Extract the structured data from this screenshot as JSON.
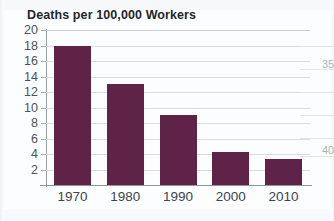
{
  "chart_data": {
    "type": "bar",
    "title": "Deaths per 100,000 Workers",
    "xlabel": "",
    "ylabel": "",
    "categories": [
      "1970",
      "1980",
      "1990",
      "2000",
      "2010"
    ],
    "values": [
      18,
      13,
      9,
      4.2,
      3.4
    ],
    "series": [
      {
        "name": "Deaths per 100,000 Workers",
        "values": [
          18,
          13,
          9,
          4.2,
          3.4
        ]
      }
    ],
    "ylim": [
      0,
      20
    ],
    "yticks": [
      "2",
      "4",
      "6",
      "8",
      "10",
      "12",
      "14",
      "16",
      "18",
      "20"
    ],
    "ytick_values": [
      2,
      4,
      6,
      8,
      10,
      12,
      14,
      16,
      18,
      20
    ],
    "grid": true,
    "legend": false,
    "legend_position": "none",
    "bar_color": "#5e2347",
    "gridline_color": "#d9dde1",
    "axis_color": "#8e959c",
    "title_color": "#23272b",
    "tick_label_color": "#4c5258",
    "background_color": "#fcfdfe"
  },
  "edge_fragments": [
    {
      "text": "35",
      "note": "clipped label from adjacent figure"
    },
    {
      "text": "40",
      "note": "clipped label from adjacent figure"
    }
  ]
}
